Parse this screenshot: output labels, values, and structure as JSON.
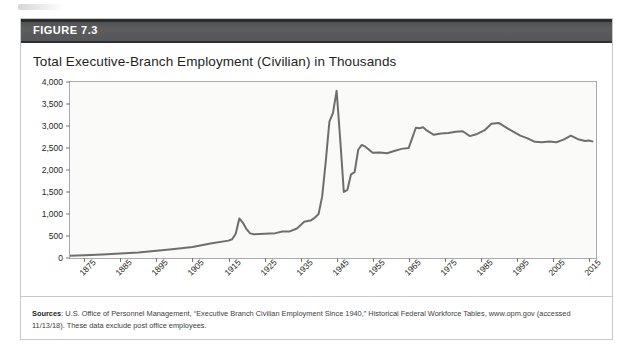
{
  "figure": {
    "number_label": "FIGURE 7.3",
    "title": "Total Executive-Branch Employment (Civilian) in Thousands",
    "header_bg": "#58595b",
    "line_color": "#6e6e6e"
  },
  "source": {
    "label": "Sources",
    "text": ": U.S. Office of Personnel Management, “Executive Branch Civilian Employment Since 1940,” Historical Federal Workforce Tables, www.opm.gov (accessed 11/13/18). These data exclude post office employees."
  },
  "chart_data": {
    "type": "line",
    "title": "Total Executive-Branch Employment (Civilian) in Thousands",
    "xlabel": "",
    "ylabel": "",
    "ylim": [
      0,
      4000
    ],
    "xlim": [
      1871,
      2017
    ],
    "ytick_values": [
      0,
      500,
      1000,
      1500,
      2000,
      2500,
      3000,
      3500,
      4000
    ],
    "ytick_labels": [
      "0",
      "500",
      "1,000",
      "1,500",
      "2,000",
      "2,500",
      "3,000",
      "3,500",
      "4,000"
    ],
    "xtick_values": [
      1875,
      1885,
      1895,
      1905,
      1915,
      1925,
      1935,
      1945,
      1955,
      1965,
      1975,
      1985,
      1995,
      2005,
      2015
    ],
    "xtick_labels": [
      "1875",
      "1885",
      "1895",
      "1905",
      "1915",
      "1925",
      "1935",
      "1945",
      "1955",
      "1965",
      "1975",
      "1985",
      "1995",
      "2005",
      "2015"
    ],
    "grid": false,
    "legend": "none",
    "series": [
      {
        "name": "Total Executive-Branch Civilian Employment (thousands)",
        "x": [
          1871,
          1875,
          1880,
          1885,
          1890,
          1895,
          1900,
          1905,
          1910,
          1915,
          1916,
          1917,
          1918,
          1919,
          1920,
          1921,
          1922,
          1925,
          1928,
          1930,
          1932,
          1934,
          1936,
          1938,
          1939,
          1940,
          1941,
          1942,
          1943,
          1944,
          1945,
          1946,
          1947,
          1948,
          1949,
          1950,
          1951,
          1952,
          1953,
          1955,
          1957,
          1959,
          1961,
          1963,
          1965,
          1966,
          1967,
          1968,
          1969,
          1970,
          1972,
          1974,
          1976,
          1978,
          1980,
          1982,
          1984,
          1986,
          1988,
          1990,
          1992,
          1994,
          1996,
          1998,
          2000,
          2002,
          2004,
          2006,
          2008,
          2010,
          2012,
          2014,
          2015,
          2016
        ],
        "values": [
          51,
          60,
          80,
          100,
          125,
          165,
          205,
          250,
          330,
          395,
          425,
          550,
          900,
          800,
          655,
          560,
          540,
          550,
          565,
          600,
          605,
          670,
          825,
          860,
          920,
          1000,
          1400,
          2200,
          3100,
          3300,
          3800,
          2700,
          1500,
          1550,
          1900,
          1950,
          2460,
          2570,
          2530,
          2390,
          2400,
          2380,
          2430,
          2480,
          2500,
          2730,
          2960,
          2950,
          2970,
          2900,
          2800,
          2830,
          2840,
          2870,
          2880,
          2770,
          2820,
          2900,
          3050,
          3070,
          2970,
          2870,
          2780,
          2720,
          2640,
          2630,
          2650,
          2630,
          2690,
          2780,
          2700,
          2660,
          2670,
          2650
        ]
      }
    ],
    "notable_points": [
      {
        "year": 1918,
        "value": 900,
        "note": "World War I peak"
      },
      {
        "year": 1945,
        "value": 3800,
        "note": "World War II peak"
      },
      {
        "year": 1947,
        "value": 1500,
        "note": "Post-war trough"
      }
    ]
  }
}
